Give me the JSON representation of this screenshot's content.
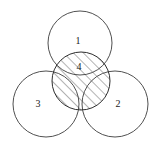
{
  "figure": {
    "type": "venn-diagram",
    "width": 156,
    "height": 151,
    "background_color": "#ffffff",
    "stroke_color": "#3c3c3c",
    "hatch_color": "#4a4a4a",
    "label_color": "#1a1a1a"
  },
  "circles": [
    {
      "id": "circle-1",
      "label": "1",
      "position": "top",
      "cx": 80,
      "cy": 43,
      "r": 32,
      "label_x": 78,
      "label_y": 42,
      "hatched": false
    },
    {
      "id": "circle-2",
      "label": "2",
      "position": "bottom-right",
      "cx": 115,
      "cy": 104,
      "r": 33,
      "label_x": 118,
      "label_y": 105,
      "hatched": false
    },
    {
      "id": "circle-3",
      "label": "3",
      "position": "bottom-left",
      "cx": 46,
      "cy": 104,
      "r": 33,
      "label_x": 38,
      "label_y": 105,
      "hatched": false
    },
    {
      "id": "circle-4",
      "label": "4",
      "position": "center",
      "cx": 81,
      "cy": 81,
      "r": 29,
      "label_x": 79,
      "label_y": 68,
      "hatched": true
    }
  ],
  "hatching": {
    "direction": "lower-left-to-upper-right",
    "angle_degrees": 45,
    "spacing_px": 7,
    "applies_to": "circle-4"
  }
}
